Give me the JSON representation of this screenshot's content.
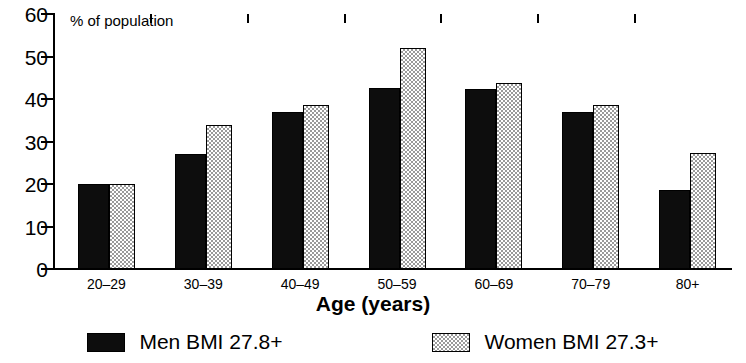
{
  "chart_data": {
    "type": "bar",
    "title": "",
    "xlabel": "Age (years)",
    "ylabel": "% of population",
    "ylim": [
      0,
      60
    ],
    "yticks": [
      0,
      10,
      20,
      30,
      40,
      50,
      60
    ],
    "grid": false,
    "legend_position": "bottom",
    "categories": [
      "20–29",
      "30–39",
      "40–49",
      "50–59",
      "60–69",
      "70–79",
      "80+"
    ],
    "series": [
      {
        "name": "Men BMI 27.8+",
        "color": "#0d0d0d",
        "fill": "solid-black",
        "values": [
          20.0,
          27.0,
          37.0,
          42.5,
          42.3,
          37.0,
          18.7
        ]
      },
      {
        "name": "Women BMI 27.3+",
        "color": "#d8d8d8",
        "fill": "light-stipple",
        "values": [
          20.0,
          34.0,
          38.5,
          52.0,
          43.8,
          38.5,
          27.3
        ]
      }
    ]
  },
  "axis_note": "% of population",
  "legend": [
    {
      "label": "Men BMI 27.8+",
      "swatch": "men"
    },
    {
      "label": "Women BMI 27.3+",
      "swatch": "women"
    }
  ]
}
